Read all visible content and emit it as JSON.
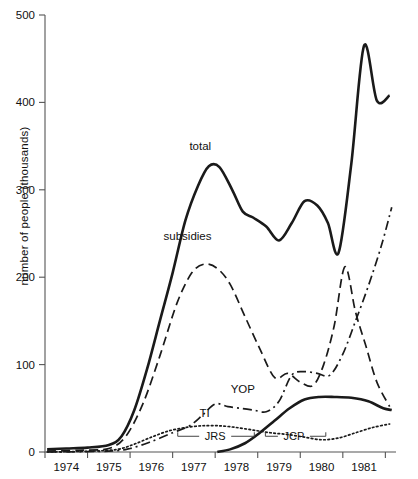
{
  "chart_data": {
    "type": "line",
    "title": "",
    "xlabel": "",
    "ylabel": "number of people (thousands)",
    "xlim": [
      1973.5,
      1981.75
    ],
    "ylim": [
      0,
      500
    ],
    "yticks": [
      0,
      100,
      200,
      300,
      400,
      500
    ],
    "ytick_labels": [
      "0",
      "100",
      "200",
      "300",
      "400",
      "500"
    ],
    "xticks": [
      1973.5,
      1974.5,
      1975.5,
      1976.5,
      1977.5,
      1978.5,
      1979.5,
      1980.5,
      1981.5
    ],
    "xtick_labels": [
      "1974",
      "1975",
      "1976",
      "1977",
      "1978",
      "1979",
      "1980",
      "1981"
    ],
    "grid": false,
    "legend": "inline-labels",
    "series": [
      {
        "name": "total",
        "style": "solid",
        "label": "total",
        "label_x": 1977.15,
        "label_y": 345,
        "x": [
          1973.55,
          1974.0,
          1974.5,
          1975.0,
          1975.3,
          1975.6,
          1975.9,
          1976.2,
          1976.5,
          1976.8,
          1977.1,
          1977.35,
          1977.6,
          1977.9,
          1978.15,
          1978.4,
          1978.7,
          1979.0,
          1979.3,
          1979.6,
          1979.9,
          1980.15,
          1980.4,
          1980.7,
          1981.0,
          1981.3,
          1981.6
        ],
        "y": [
          3,
          4,
          5,
          8,
          18,
          48,
          95,
          150,
          205,
          265,
          305,
          327,
          326,
          300,
          275,
          268,
          258,
          242,
          262,
          287,
          282,
          262,
          228,
          330,
          465,
          402,
          408
        ]
      },
      {
        "name": "subsidies",
        "style": "long-dash",
        "label": "subsidies",
        "label_x": 1976.85,
        "label_y": 243,
        "x": [
          1973.55,
          1974.3,
          1975.0,
          1975.4,
          1975.8,
          1976.2,
          1976.6,
          1976.95,
          1977.25,
          1977.55,
          1977.85,
          1978.2,
          1978.55,
          1978.9,
          1979.2,
          1979.5,
          1979.8,
          1980.05,
          1980.3,
          1980.55,
          1980.8,
          1981.05,
          1981.3,
          1981.6
        ],
        "y": [
          1,
          2,
          4,
          18,
          55,
          110,
          170,
          205,
          215,
          210,
          192,
          155,
          118,
          85,
          90,
          80,
          76,
          100,
          145,
          212,
          160,
          120,
          80,
          52
        ]
      },
      {
        "name": "YOP",
        "style": "dash-dot",
        "label": "YOP",
        "label_x": 1978.15,
        "label_y": 68,
        "x": [
          1973.55,
          1975.0,
          1975.5,
          1976.0,
          1976.5,
          1976.9,
          1977.2,
          1977.5,
          1977.8,
          1978.1,
          1978.4,
          1978.7,
          1979.0,
          1979.3,
          1979.6,
          1979.9,
          1980.2,
          1980.5,
          1980.8,
          1981.1,
          1981.4,
          1981.65
        ],
        "y": [
          0,
          1,
          4,
          12,
          22,
          30,
          42,
          55,
          52,
          50,
          48,
          46,
          58,
          88,
          92,
          90,
          88,
          112,
          150,
          190,
          235,
          280
        ]
      },
      {
        "name": "TI",
        "style": "dotted",
        "label": "TI",
        "label_x": 1977.25,
        "label_y": 40,
        "x": [
          1973.55,
          1974.6,
          1975.2,
          1975.6,
          1976.0,
          1976.4,
          1976.8,
          1977.2,
          1977.6,
          1978.0,
          1978.4,
          1978.8,
          1979.2,
          1979.6,
          1980.0,
          1980.4,
          1980.8,
          1981.2,
          1981.6
        ],
        "y": [
          0,
          1,
          3,
          9,
          17,
          24,
          28,
          30,
          30,
          28,
          25,
          22,
          20,
          17,
          14,
          16,
          22,
          28,
          32
        ]
      },
      {
        "name": "unlabelled-solid-lower",
        "style": "solid",
        "x": [
          1977.55,
          1977.85,
          1978.2,
          1978.55,
          1978.9,
          1979.25,
          1979.6,
          1979.95,
          1980.3,
          1980.7,
          1981.1,
          1981.45,
          1981.65
        ],
        "y": [
          0,
          3,
          10,
          22,
          36,
          50,
          60,
          63,
          63,
          62,
          58,
          50,
          48
        ]
      }
    ],
    "annotations": [
      {
        "label": "JRS",
        "x_start": 1976.62,
        "x_end": 1978.42,
        "y": 18,
        "label_x": 1977.5
      },
      {
        "label": "JCP",
        "x_start": 1978.68,
        "x_end": 1980.1,
        "y": 18,
        "label_x": 1979.35
      }
    ]
  }
}
